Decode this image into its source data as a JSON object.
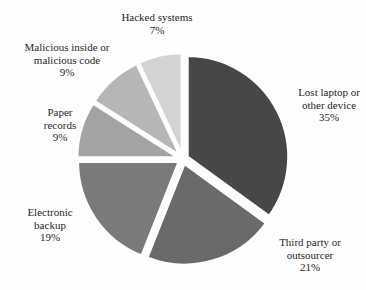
{
  "chart_data": {
    "type": "pie",
    "title": "",
    "unit": "%",
    "start_angle_deg": 0,
    "direction": "clockwise",
    "categories": [
      "Lost laptop or other device",
      "Third party or outsourcer",
      "Electronic backup",
      "Paper records",
      "Malicious inside or malicious code",
      "Hacked systems"
    ],
    "values": [
      35,
      21,
      19,
      9,
      9,
      7
    ],
    "slice_colors": [
      "#474747",
      "#6a6a6a",
      "#7a7a7a",
      "#a3a3a3",
      "#b6b6b6",
      "#d3d3d3"
    ],
    "gap_color": "#ffffff",
    "labels": [
      {
        "lines": [
          "Lost laptop or",
          "other device",
          "35%"
        ]
      },
      {
        "lines": [
          "Third party or",
          "outsourcer",
          "21%"
        ]
      },
      {
        "lines": [
          "Electronic",
          "backup",
          "19%"
        ]
      },
      {
        "lines": [
          "Paper",
          "records",
          "9%"
        ]
      },
      {
        "lines": [
          "Malicious inside or",
          "malicious code",
          "9%"
        ]
      },
      {
        "lines": [
          "Hacked systems",
          "7%"
        ]
      }
    ]
  }
}
